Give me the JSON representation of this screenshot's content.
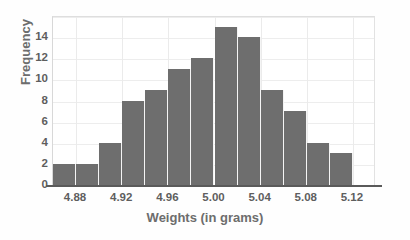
{
  "chart_data": {
    "type": "bar",
    "title": "",
    "subtitle": "",
    "xlabel": "Weights (in grams)",
    "ylabel": "Frequency",
    "bar_color": "#6e6e6e",
    "grid": true,
    "legend": "none",
    "ylim": [
      0,
      16
    ],
    "ytick_labels": [
      "0",
      "2",
      "4",
      "6",
      "8",
      "10",
      "12",
      "14"
    ],
    "ytick_values": [
      0,
      2,
      4,
      6,
      8,
      10,
      12,
      14
    ],
    "xtick_labels": [
      "4.88",
      "4.92",
      "4.96",
      "5.00",
      "5.04",
      "5.08",
      "5.12"
    ],
    "xtick_values": [
      4.88,
      4.92,
      4.96,
      5.0,
      5.04,
      5.08,
      5.12
    ],
    "xlim": [
      4.86,
      5.14
    ],
    "bin_width": 0.02,
    "bin_starts": [
      4.86,
      4.88,
      4.9,
      4.92,
      4.94,
      4.96,
      4.98,
      5.0,
      5.02,
      5.04,
      5.06,
      5.08,
      5.1,
      5.12
    ],
    "categories": [
      "4.86-4.88",
      "4.88-4.90",
      "4.90-4.92",
      "4.92-4.94",
      "4.94-4.96",
      "4.96-4.98",
      "4.98-5.00",
      "5.00-5.02",
      "5.02-5.04",
      "5.04-5.06",
      "5.06-5.08",
      "5.08-5.10",
      "5.10-5.12",
      "5.12-5.14"
    ],
    "values": [
      2,
      2,
      4,
      8,
      9,
      11,
      12,
      15,
      14,
      9,
      7,
      4,
      3,
      0
    ]
  }
}
